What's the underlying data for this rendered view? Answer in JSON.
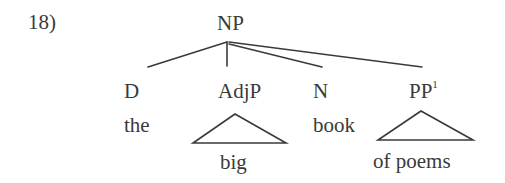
{
  "example_number": "18)",
  "tree": {
    "root": {
      "label": "NP"
    },
    "children": [
      {
        "category": "D",
        "superscript": "",
        "word": "the",
        "triangle": false
      },
      {
        "category": "AdjP",
        "superscript": "",
        "word": "big",
        "triangle": true
      },
      {
        "category": "N",
        "superscript": "",
        "word": "book",
        "triangle": false
      },
      {
        "category": "PP",
        "superscript": "1",
        "word": "of poems",
        "triangle": true
      }
    ]
  },
  "colors": {
    "ink": "#3a3a3a",
    "background": "#ffffff"
  }
}
